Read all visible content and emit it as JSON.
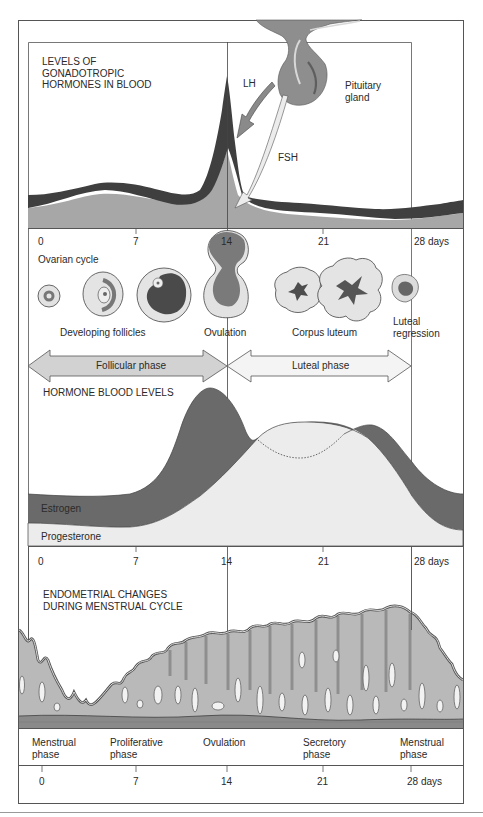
{
  "colors": {
    "frame": "#555555",
    "lh_dark": "#3f3f3f",
    "fsh_mid": "#a7a7a7",
    "gland": "#8e8e8e",
    "estrogen": "#6a6a6a",
    "progesterone": "#ececec",
    "endometrium": "#b9b9b9",
    "basal_layer": "#8a8a8a",
    "arrow_follicular": "#d2d2d2",
    "arrow_luteal": "#f4f4f4"
  },
  "gonadotropic": {
    "title": "LEVELS OF\nGONADOTROPIC\nHORMONES IN BLOOD",
    "lh_label": "LH",
    "fsh_label": "FSH",
    "gland_label": "Pituitary\ngland",
    "gland_icon": "pituitary-gland-icon"
  },
  "axis_top": {
    "ticks": [
      "0",
      "7",
      "14",
      "21",
      "28 days"
    ]
  },
  "ovarian": {
    "title": "Ovarian cycle",
    "labels": {
      "developing": "Developing follicles",
      "ovulation": "Ovulation",
      "corpus": "Corpus luteum",
      "regression": "Luteal\nregression"
    },
    "phases": {
      "follicular": "Follicular phase",
      "luteal": "Luteal phase"
    }
  },
  "hormones": {
    "title": "HORMONE BLOOD LEVELS",
    "estrogen": "Estrogen",
    "progesterone": "Progesterone"
  },
  "axis_mid": {
    "ticks": [
      "0",
      "7",
      "14",
      "21",
      "28 days"
    ]
  },
  "endometrial": {
    "title": "ENDOMETRIAL CHANGES\nDURING MENSTRUAL CYCLE",
    "phases": [
      "Menstrual\nphase",
      "Proliferative\nphase",
      "Ovulation",
      "Secretory\nphase",
      "Menstrual\nphase"
    ]
  },
  "axis_bottom": {
    "ticks": [
      "0",
      "7",
      "14",
      "21",
      "28 days"
    ]
  }
}
